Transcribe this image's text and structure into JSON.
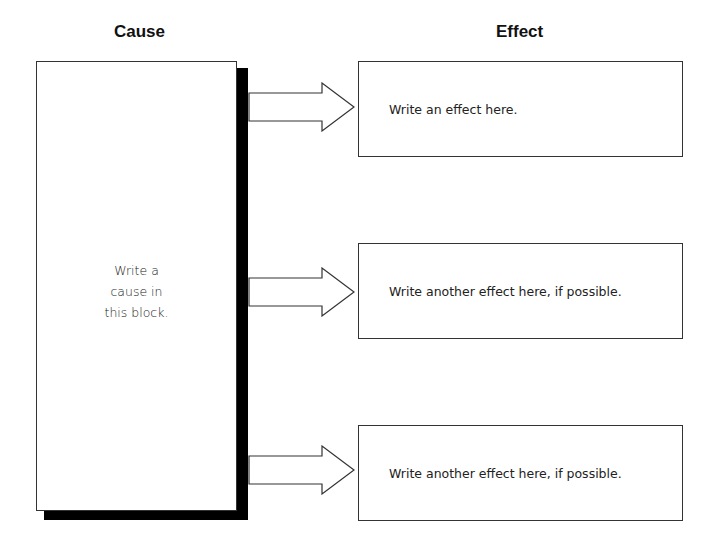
{
  "headings": {
    "cause": "Cause",
    "effect": "Effect"
  },
  "cause_block": {
    "text": "Write a\ncause in\nthis block."
  },
  "effects": [
    {
      "text": "Write an effect here."
    },
    {
      "text": "Write another effect here, if possible."
    },
    {
      "text": "Write another effect here, if possible."
    }
  ],
  "colors": {
    "border": "#333333",
    "shadow": "#000000",
    "background": "#ffffff",
    "text": "#222222"
  }
}
